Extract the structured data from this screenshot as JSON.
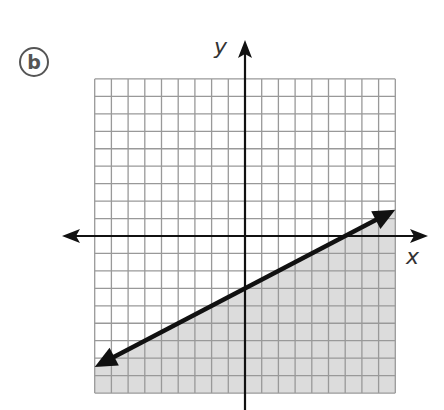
{
  "panel_label": "b",
  "axes": {
    "x_label": "x",
    "y_label": "y"
  },
  "chart_data": {
    "type": "line",
    "title": "",
    "xlabel": "x",
    "ylabel": "y",
    "xlim": [
      -9,
      9
    ],
    "ylim": [
      -9,
      9
    ],
    "grid": true,
    "grid_step": 1,
    "series": [
      {
        "name": "boundary line y = 0.5x - 3",
        "x": [
          -9,
          9
        ],
        "y": [
          -7.5,
          1.5
        ],
        "style": "solid",
        "arrows": "both"
      }
    ],
    "shaded_region": "below line (y < 0.5x - 3)",
    "colors": {
      "shade": "#dcdcdc",
      "grid": "#999999",
      "line": "#111111"
    }
  }
}
